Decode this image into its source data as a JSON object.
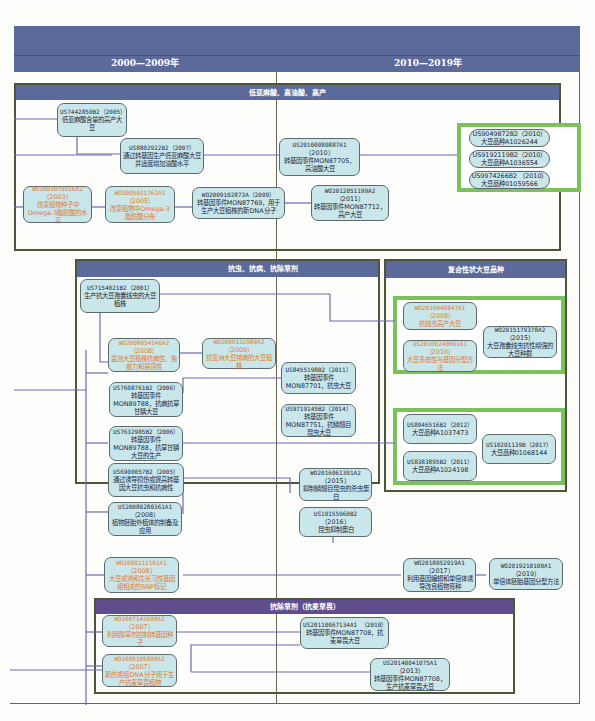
{
  "header": {
    "eras": [
      "2000—2009年",
      "2010—2019年"
    ]
  },
  "regions": {
    "r1": "低亚麻酸、高油酸、高产",
    "r2": "抗虫、抗病、抗除草剂",
    "r3": "复合性状大豆品种",
    "r4": "抗除草剂（抗麦草畏）"
  },
  "nodes": {
    "n1": {
      "id": "US7442850B2（2005）",
      "text": "低亚麻酸含量的高产大豆",
      "color": "dark"
    },
    "n2": {
      "id": "US8802922B2（2007）",
      "text": "通过转基因生产低亚麻酸大豆并适度增加油酸水平",
      "color": "dark"
    },
    "n3": {
      "id": "US20100080887A1",
      "year": "（2010）",
      "text": "转基因事件MON87705，高油酸大豆",
      "color": "dark"
    },
    "n4": {
      "id": "WO2003079916A2",
      "year": "（2003）",
      "text": "改变植物种子中Omega-3脂肪酸的水平",
      "color": "orange"
    },
    "n5": {
      "id": "WO2005021761A1",
      "year": "（2005）",
      "text": "改变植物中Omega-3脂肪酸分布",
      "color": "orange"
    },
    "n6": {
      "id": "WO2009102873A（2009）",
      "text": "转基因事件MON87769，用于生产大豆植株的新DNA分子",
      "color": "dark"
    },
    "n7": {
      "id": "WO2012051199A2",
      "year": "（2011）",
      "text": "转基因事件MON87712，高产大豆",
      "color": "dark"
    },
    "n8": {
      "id": "US7154021B2（2001）",
      "text": "生产抗大豆孢囊线虫的大豆植株",
      "color": "dark"
    },
    "n9": {
      "id": "WO2008054546A2",
      "year": "（2008）",
      "text": "监测大豆植株抗病性、免疫力和易感性",
      "color": "orange"
    },
    "n10": {
      "id": "WO2009132089A2",
      "year": "（2009）",
      "text": "抗亚洲大豆锈病的大豆植株",
      "color": "orange"
    },
    "n11": {
      "id": "US7608761B2（2006）",
      "text": "转基因事件MON89788，抗病抗草甘膦大豆",
      "color": "dark"
    },
    "n12": {
      "id": "US7632985B2（2006）",
      "text": "转基因事件MON89788，抗草甘膦大豆的生产",
      "color": "dark"
    },
    "n13": {
      "id": "US6900057B2（2005）",
      "text": "通过诱导损伤或提高转基因大豆抗虫和抗病性",
      "color": "dark"
    },
    "n14": {
      "id": "US20080280361A1",
      "year": "（2008）",
      "text": "植物胚胎外植体的制备及应用",
      "color": "dark"
    },
    "n15": {
      "id": "US8455198B2（2011）",
      "text": "转基因事件MON87701，抗虫大豆",
      "color": "dark"
    },
    "n16": {
      "id": "US9719145B2（2014）",
      "text": "转基因事件MON87751，抗鳞翅目昆虫大豆",
      "color": "dark"
    },
    "n17": {
      "id": "WO2016061391A2",
      "year": "（2015）",
      "text": "抑制鳞翅目昆虫的杀虫蛋白",
      "color": "dark"
    },
    "n18": {
      "id": "US10155960B2",
      "year": "（2016）",
      "text": "昆虫抑制蛋白",
      "color": "dark"
    },
    "n19": {
      "id": "WO2010048847A1",
      "year": "（2008）",
      "text": "抗线虫高产大豆",
      "color": "orange"
    },
    "n20": {
      "id": "US20100240061A1",
      "year": "（2010）",
      "text": "大豆多态性与基因分型方法",
      "color": "orange"
    },
    "n21": {
      "id": "WO2015179378A2",
      "year": "（2015）",
      "text": "大豆孢囊线虫抗性增强的大豆种群",
      "color": "dark"
    },
    "n22": {
      "id": "US8946516B2（2012）",
      "text": "大豆品种A1037473",
      "color": "dark"
    },
    "n23": {
      "id": "US8383895B2（2011）",
      "text": "大豆品种A1024198",
      "color": "dark"
    },
    "n24": {
      "id": "US10201139B（2017）",
      "text": "大豆品种01068144",
      "color": "dark"
    },
    "n25": {
      "id": "WO2008112191A1",
      "year": "（2008）",
      "text": "大豆成熟和生长习性基因组相关的SNP标记",
      "color": "orange"
    },
    "n26": {
      "id": "WO2018052919A1",
      "year": "（2017）",
      "text": "利用基因编辑和单倍体诱导改良植物育种",
      "color": "dark"
    },
    "n27": {
      "id": "WO2019210100A1",
      "year": "（2019）",
      "text": "单倍体胚胎基因分型方法",
      "color": "dark"
    },
    "n28": {
      "id": "WO2007143690A2",
      "year": "（2007）",
      "text": "利用除草剂控制转基因种子",
      "color": "orange"
    },
    "n29": {
      "id": "WO2008105890A2",
      "year": "（2007）",
      "text": "新的重组DNA分子用于生产抗麦草畏植物",
      "color": "orange"
    },
    "n30": {
      "id": "US20110067134A1 （2010）",
      "text": "转基因事件MON87708，抗麦草畏大豆",
      "color": "dark"
    },
    "n31": {
      "id": "US20140041075A1",
      "year": "（2013）",
      "text": "转基因事件MON87708，生产抗麦草畏大豆",
      "color": "dark"
    }
  },
  "pills": {
    "p1": {
      "id": "US9049872B2（2010）",
      "text": "大豆品种A1026244"
    },
    "p2": {
      "id": "US9192119B2（2010）",
      "text": "大豆品种A1036554"
    },
    "p3": {
      "id": "US9974266B2 （2010）",
      "text": "大豆品种01059566"
    }
  },
  "colors": {
    "header": "#5b6a9a",
    "region_head_purple": "#5f4d8e",
    "node_fill": "#c9e6ea",
    "highlight_green": "#7cc25a",
    "connector": "#6a6ab8",
    "orange_text": "#e07b2a"
  }
}
